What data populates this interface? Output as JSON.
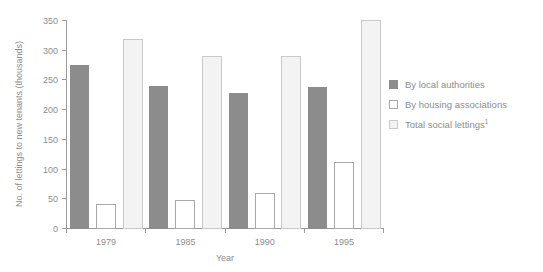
{
  "chart_data": {
    "type": "bar",
    "title": "",
    "xlabel": "Year",
    "ylabel": "No. of lettings to new tenants (thousands)",
    "categories": [
      "1979",
      "1985",
      "1990",
      "1995"
    ],
    "ylim": [
      0,
      350
    ],
    "yticks": [
      0,
      50,
      100,
      150,
      200,
      250,
      300,
      350
    ],
    "ytick_labels": [
      "0",
      "50",
      "100",
      "150",
      "200",
      "250",
      "300",
      "350"
    ],
    "grid": false,
    "legend_position": "right",
    "series": [
      {
        "name": "By local authorities",
        "style": "filled-gray",
        "color": "#8c8c8c",
        "values": [
          275,
          239,
          227,
          237
        ]
      },
      {
        "name": "By housing associations",
        "style": "open-white",
        "color": "#ffffff",
        "values": [
          41,
          47,
          58,
          110
        ]
      },
      {
        "name": "Total social lettings",
        "footnote": "1",
        "style": "light-fill",
        "color": "#f3f3f3",
        "values": [
          318,
          289,
          289,
          349
        ]
      }
    ]
  },
  "legend": {
    "items": [
      {
        "label": "By local authorities",
        "footnote": ""
      },
      {
        "label": "By housing associations",
        "footnote": ""
      },
      {
        "label": "Total social lettings",
        "footnote": "1"
      }
    ]
  },
  "axes": {
    "y_title": "No. of lettings to new tenants (thousands)",
    "x_title": "Year"
  }
}
